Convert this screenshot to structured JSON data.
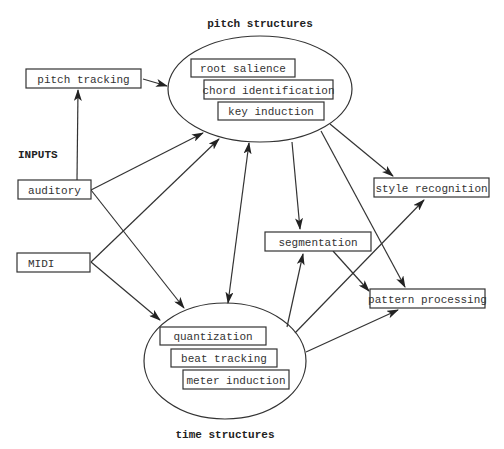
{
  "diagram": {
    "labels": {
      "pitch_structures": "pitch structures",
      "time_structures": "time structures",
      "inputs": "INPUTS"
    },
    "nodes": {
      "pitch_tracking": "pitch tracking",
      "auditory": "auditory",
      "midi": "MIDI",
      "root_salience": "root salience",
      "chord_identification": "chord identification",
      "key_induction": "key induction",
      "quantization": "quantization",
      "beat_tracking": "beat tracking",
      "meter_induction": "meter induction",
      "style_recognition": "style recognition",
      "segmentation": "segmentation",
      "pattern_processing": "pattern processing"
    },
    "groups": {
      "pitch_structures": [
        "root salience",
        "chord identification",
        "key induction"
      ],
      "time_structures": [
        "quantization",
        "beat tracking",
        "meter induction"
      ]
    },
    "edges": [
      {
        "from": "auditory",
        "to": "pitch tracking",
        "type": "arrow"
      },
      {
        "from": "pitch tracking",
        "to": "pitch structures",
        "type": "arrow"
      },
      {
        "from": "auditory",
        "to": "pitch structures",
        "type": "arrow"
      },
      {
        "from": "MIDI",
        "to": "pitch structures",
        "type": "arrow"
      },
      {
        "from": "auditory",
        "to": "time structures",
        "type": "arrow"
      },
      {
        "from": "MIDI",
        "to": "time structures",
        "type": "arrow"
      },
      {
        "from": "pitch structures",
        "to": "time structures",
        "type": "bidirectional"
      },
      {
        "from": "pitch structures",
        "to": "segmentation",
        "type": "arrow"
      },
      {
        "from": "pitch structures",
        "to": "style recognition",
        "type": "arrow"
      },
      {
        "from": "pitch structures",
        "to": "pattern processing",
        "type": "arrow"
      },
      {
        "from": "time structures",
        "to": "segmentation",
        "type": "arrow"
      },
      {
        "from": "time structures",
        "to": "style recognition",
        "type": "arrow"
      },
      {
        "from": "time structures",
        "to": "pattern processing",
        "type": "arrow"
      },
      {
        "from": "segmentation",
        "to": "pattern processing",
        "type": "arrow"
      }
    ]
  }
}
